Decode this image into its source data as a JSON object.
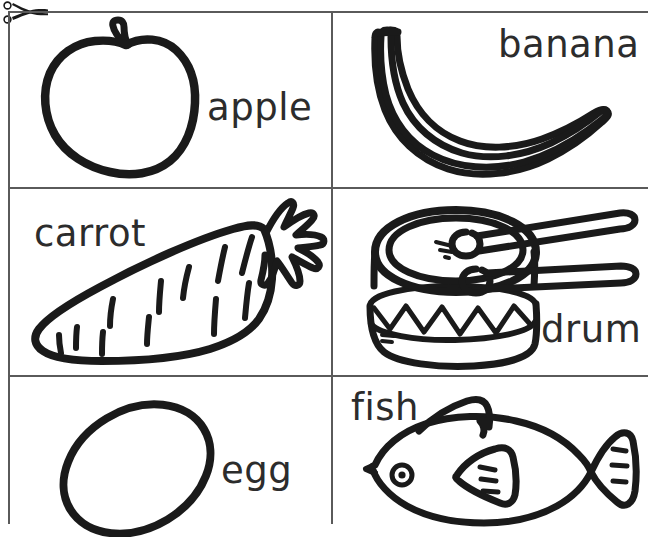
{
  "sheet": {
    "title": "Picture Word Cards",
    "background_color": "#ffffff",
    "ink_color": "#1a1a1a",
    "text_color": "#2c2c2c",
    "rule_color": "#5a5a5a",
    "columns": 2,
    "rows": 3,
    "cut_marker": "scissors-icon"
  },
  "cards": [
    {
      "word": "apple",
      "picture": "apple-drawing",
      "label_position": "middle-right",
      "row": 1,
      "column": 1
    },
    {
      "word": "banana",
      "picture": "banana-drawing",
      "label_position": "top-right",
      "row": 1,
      "column": 2
    },
    {
      "word": "carrot",
      "picture": "carrot-drawing",
      "label_position": "top-left",
      "row": 2,
      "column": 1
    },
    {
      "word": "drum",
      "picture": "drum-drawing",
      "label_position": "bottom-right",
      "row": 2,
      "column": 2
    },
    {
      "word": "egg",
      "picture": "egg-drawing",
      "label_position": "middle-right",
      "row": 3,
      "column": 1
    },
    {
      "word": "fish",
      "picture": "fish-drawing",
      "label_position": "top-left",
      "row": 3,
      "column": 2
    }
  ]
}
